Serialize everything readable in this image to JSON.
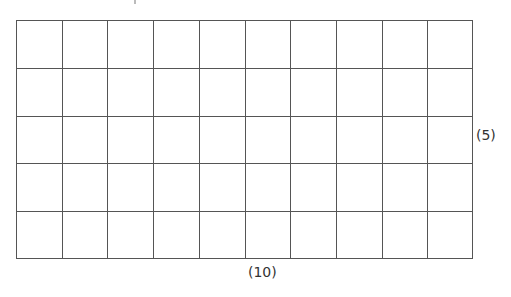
{
  "diagram": {
    "type": "rectangular-grid",
    "columns": 10,
    "rows": 5,
    "line_color": "#555555",
    "background": "#ffffff",
    "labels": {
      "right": "(5)",
      "bottom": "(10)"
    }
  }
}
